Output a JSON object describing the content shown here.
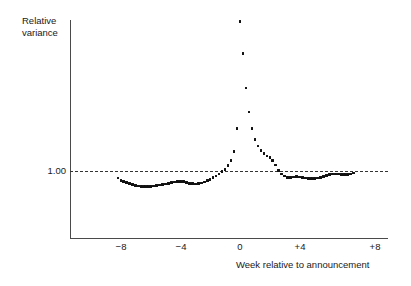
{
  "chart_data": {
    "type": "scatter",
    "title": "",
    "xlabel": "Week relative to announcement",
    "ylabel": "Relative\nvariance",
    "x_tick_labels": [
      "−8",
      "−4",
      "0",
      "+4",
      "+8"
    ],
    "x_tick_values": [
      -8,
      -4,
      0,
      4,
      8
    ],
    "y_tick_labels": [
      "1.00"
    ],
    "y_tick_values": [
      1.0
    ],
    "xlim": [
      -9.5,
      9.0
    ],
    "ylim": [
      0.7,
      3.0
    ],
    "grid": false,
    "legend": null,
    "reference_line": {
      "value": 1.0,
      "style": "dashed",
      "label": "1.00"
    },
    "marker": "square-dot",
    "series": [
      {
        "name": "Relative variance",
        "x": [
          -8.2,
          -8.0,
          -7.8,
          -7.6,
          -7.4,
          -7.2,
          -7.0,
          -6.8,
          -6.6,
          -6.4,
          -6.2,
          -6.0,
          -5.8,
          -5.6,
          -5.4,
          -5.2,
          -5.0,
          -4.8,
          -4.6,
          -4.4,
          -4.2,
          -4.0,
          -3.8,
          -3.6,
          -3.4,
          -3.2,
          -3.0,
          -2.8,
          -2.6,
          -2.4,
          -2.2,
          -2.0,
          -1.8,
          -1.6,
          -1.4,
          -1.2,
          -1.0,
          -0.8,
          -0.6,
          -0.4,
          -0.2,
          0.0,
          0.2,
          0.4,
          0.6,
          0.8,
          1.0,
          1.2,
          1.4,
          1.6,
          1.8,
          2.0,
          2.2,
          2.4,
          2.6,
          2.8,
          3.0,
          3.2,
          3.4,
          3.6,
          3.8,
          4.0,
          4.2,
          4.4,
          4.6,
          4.8,
          5.0,
          5.2,
          5.4,
          5.6,
          5.8,
          6.0,
          6.2,
          6.4,
          6.6,
          6.8,
          7.0,
          7.2,
          7.4,
          7.6
        ],
        "y": [
          0.905,
          0.878,
          0.86,
          0.845,
          0.832,
          0.82,
          0.81,
          0.802,
          0.797,
          0.794,
          0.793,
          0.795,
          0.8,
          0.806,
          0.813,
          0.82,
          0.828,
          0.836,
          0.845,
          0.852,
          0.858,
          0.861,
          0.857,
          0.848,
          0.838,
          0.831,
          0.828,
          0.831,
          0.84,
          0.854,
          0.871,
          0.89,
          0.912,
          0.936,
          0.962,
          0.99,
          1.022,
          1.07,
          1.14,
          1.26,
          1.56,
          2.98,
          2.56,
          2.1,
          1.78,
          1.56,
          1.42,
          1.33,
          1.27,
          1.23,
          1.2,
          1.18,
          1.14,
          1.08,
          1.01,
          0.962,
          0.932,
          0.916,
          0.912,
          0.918,
          0.925,
          0.921,
          0.913,
          0.906,
          0.9,
          0.897,
          0.899,
          0.906,
          0.917,
          0.93,
          0.942,
          0.952,
          0.958,
          0.96,
          0.958,
          0.955,
          0.952,
          0.952,
          0.958,
          0.972
        ]
      }
    ]
  },
  "labels": {
    "y_axis_title": "Relative\nvariance",
    "x_axis_title": "Week relative to announcement",
    "y_tick_1": "1.00",
    "x_tick_m8": "−8",
    "x_tick_m4": "−4",
    "x_tick_0": "0",
    "x_tick_p4": "+4",
    "x_tick_p8": "+8"
  },
  "colors": {
    "background": "#ffffff",
    "axis": "#4a4a4a",
    "marker": "#111111",
    "reference_line": "#333333",
    "text": "#1a1a1a"
  }
}
